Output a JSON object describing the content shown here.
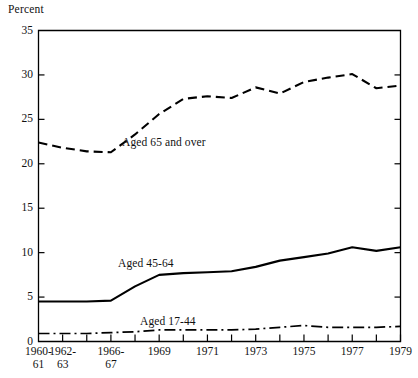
{
  "chart_data": {
    "type": "line",
    "title": "",
    "ylabel": "Percent",
    "xlabel": "",
    "ylim": [
      0,
      35
    ],
    "yticks": [
      0,
      5,
      10,
      15,
      20,
      25,
      30,
      35
    ],
    "ytick_labels": [
      "0",
      "5",
      "10",
      "15",
      "20",
      "25",
      "30",
      "35"
    ],
    "grid": false,
    "legend_position": "inline-annotation",
    "x": [
      "1960-61",
      "1962-63",
      "1964-65",
      "1966-67",
      "1968",
      "1969",
      "1970",
      "1971",
      "1972",
      "1973",
      "1974",
      "1975",
      "1976",
      "1977",
      "1978",
      "1979"
    ],
    "xtick_labels": [
      {
        "line1": "1960-",
        "line2": "61"
      },
      {
        "line1": "1962-",
        "line2": "63"
      },
      {
        "line1": "1966-",
        "line2": "67"
      },
      {
        "line1": "1969",
        "line2": ""
      },
      {
        "line1": "1971",
        "line2": ""
      },
      {
        "line1": "1973",
        "line2": ""
      },
      {
        "line1": "1975",
        "line2": ""
      },
      {
        "line1": "1977",
        "line2": ""
      },
      {
        "line1": "1979",
        "line2": ""
      }
    ],
    "series": [
      {
        "name": "Aged 65 and over",
        "style": "dashed",
        "color": "#000000",
        "values": [
          22.4,
          21.8,
          21.4,
          21.3,
          23.3,
          25.6,
          27.3,
          27.6,
          27.4,
          28.6,
          27.9,
          29.2,
          29.7,
          30.1,
          28.5,
          28.8
        ]
      },
      {
        "name": "Aged 45-64",
        "style": "solid",
        "color": "#000000",
        "values": [
          4.5,
          4.5,
          4.5,
          4.6,
          6.2,
          7.5,
          7.7,
          7.8,
          7.9,
          8.4,
          9.1,
          9.5,
          9.9,
          10.6,
          10.2,
          10.6
        ]
      },
      {
        "name": "Aged 17-44",
        "style": "dashdot",
        "color": "#000000",
        "values": [
          0.9,
          0.9,
          0.9,
          1.0,
          1.1,
          1.3,
          1.3,
          1.3,
          1.3,
          1.4,
          1.6,
          1.8,
          1.6,
          1.6,
          1.6,
          1.7
        ]
      }
    ],
    "annotations": [
      {
        "text": "Aged 65 and over",
        "x_px": 122,
        "y_px": 136
      },
      {
        "text": "Aged 45-64",
        "x_px": 118,
        "y_px": 257
      },
      {
        "text": "Aged 17-44",
        "x_px": 140,
        "y_px": 315
      }
    ]
  }
}
